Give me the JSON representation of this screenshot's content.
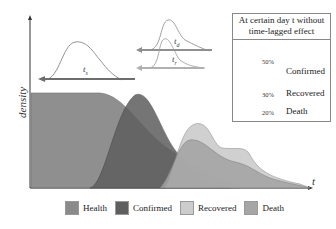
{
  "diagram": {
    "axes": {
      "y_label": "density",
      "x_label": "t"
    },
    "curves": {
      "series": [
        {
          "name": "Health",
          "color": "#8a8a8a"
        },
        {
          "name": "Confirmed",
          "color": "#5c5c5c"
        },
        {
          "name": "Recovered",
          "color": "#c9c9c9"
        },
        {
          "name": "Death",
          "color": "#a3a3a3"
        }
      ]
    },
    "lag_arrows": [
      {
        "label": "t",
        "sub": "s",
        "color": "#6e6e6e"
      },
      {
        "label": "t",
        "sub": "d",
        "color": "#8f8f8f"
      },
      {
        "label": "t",
        "sub": "r",
        "color": "#b0b0b0"
      }
    ],
    "inset": {
      "title_line1": "At certain day t without",
      "title_line2": "time-lagged effect",
      "rows": [
        {
          "pct": "50%",
          "label": "Confirmed",
          "color": "#6a6a6a"
        },
        {
          "pct": "30%",
          "label": "Recovered",
          "color": "#cfcfcf"
        },
        {
          "pct": "20%",
          "label": "Death",
          "color": "#a0a0a0"
        }
      ]
    },
    "legend": [
      {
        "label": "Health",
        "color": "#8a8a8a"
      },
      {
        "label": "Confirmed",
        "color": "#5e5e5e"
      },
      {
        "label": "Recovered",
        "color": "#cccccc"
      },
      {
        "label": "Death",
        "color": "#a6a6a6"
      }
    ]
  }
}
